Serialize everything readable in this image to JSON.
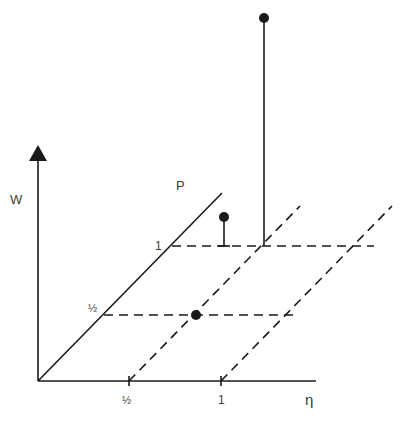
{
  "figure": {
    "type": "3d-stem-diagram",
    "axes": {
      "vertical": {
        "label": "W"
      },
      "horizontal": {
        "label": "η",
        "ticks": [
          "½",
          "1"
        ]
      },
      "depth": {
        "label": "P",
        "ticks": [
          "½",
          "1"
        ]
      }
    },
    "points": [
      {
        "eta": "½",
        "P": "½",
        "W": "0",
        "description": "point on plane"
      },
      {
        "eta": "½",
        "P": "1",
        "W": "small",
        "description": "short stem"
      },
      {
        "eta": "1",
        "P": "1",
        "W": "large",
        "description": "tall stem"
      }
    ],
    "colors": {
      "ink": "#1a1a1a",
      "label": "#3a3a3a",
      "background": "#ffffff"
    }
  }
}
